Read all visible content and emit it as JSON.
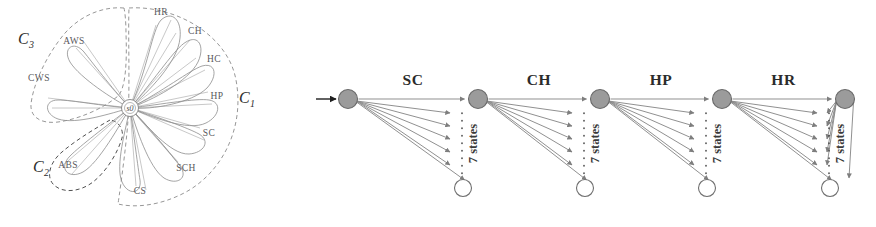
{
  "figure": {
    "background": "#ffffff",
    "width": 876,
    "height": 227
  },
  "left_panel": {
    "name": "flower-state-cluster-diagram",
    "hub_label": "s0",
    "petals": [
      {
        "id": "HR",
        "label": "HR",
        "angle_deg": -78
      },
      {
        "id": "CH",
        "label": "CH",
        "angle_deg": -56
      },
      {
        "id": "HC",
        "label": "HC",
        "angle_deg": -30
      },
      {
        "id": "HP",
        "label": "HP",
        "angle_deg": -5
      },
      {
        "id": "SC",
        "label": "SC",
        "angle_deg": 22
      },
      {
        "id": "SCH",
        "label": "SCH",
        "angle_deg": 48
      },
      {
        "id": "CS",
        "label": "CS",
        "angle_deg": 80
      },
      {
        "id": "ABS",
        "label": "ABS",
        "angle_deg": 140
      },
      {
        "id": "CWS",
        "label": "CWS",
        "angle_deg": 190
      },
      {
        "id": "AWS",
        "label": "AWS",
        "angle_deg": 228
      }
    ],
    "clusters": [
      {
        "id": "C1",
        "label": "C",
        "subscript": "1",
        "members": [
          "HR",
          "CH",
          "HC",
          "HP",
          "SC",
          "SCH",
          "CS"
        ],
        "style": "light"
      },
      {
        "id": "C2",
        "label": "C",
        "subscript": "2",
        "members": [
          "ABS"
        ],
        "style": "dark"
      },
      {
        "id": "C3",
        "label": "C",
        "subscript": "3",
        "members": [
          "CWS",
          "AWS"
        ],
        "style": "light"
      }
    ]
  },
  "right_panel": {
    "name": "markov-chain-diagram",
    "states_note": "7 states",
    "entry_marker": "arrow",
    "transitions": [
      {
        "label": "SC"
      },
      {
        "label": "CH"
      },
      {
        "label": "HP"
      },
      {
        "label": "HR"
      }
    ],
    "nodes": [
      {
        "index": 0,
        "type": "filled"
      },
      {
        "index": 1,
        "type": "filled"
      },
      {
        "index": 2,
        "type": "filled"
      },
      {
        "index": 3,
        "type": "filled"
      },
      {
        "index": 4,
        "type": "filled"
      }
    ],
    "branch_count": 7,
    "colors": {
      "node_fill": "#9b9b9b",
      "node_stroke": "#6a6a6a",
      "edge": "#8a8a8a",
      "label": "#2b2b2b"
    }
  }
}
